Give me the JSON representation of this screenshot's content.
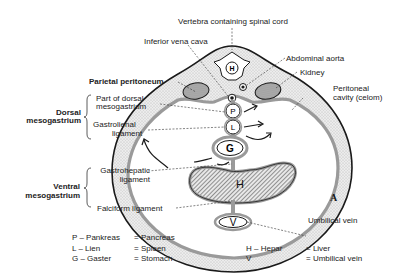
{
  "figure": {
    "letter": "A",
    "labels": {
      "vertebra": "Vertebra containing spinal cord",
      "inferior_vena_cava": "Inferior vena cava",
      "abdominal_aorta": "Abdominal aorta",
      "kidney": "Kidney",
      "parietal_peritoneum": "Parietal peritoneum",
      "peritoneal_cavity_line1": "Peritoneal",
      "peritoneal_cavity_line2": "cavity (celom)",
      "part_dorsal_line1": "Part of dorsal",
      "part_dorsal_line2": "mesogastrium",
      "gastrolienal_line1": "Gastrolienal",
      "gastrolienal_line2": "ligament",
      "dorsal_meso_line1": "Dorsal",
      "dorsal_meso_line2": "mesogastrium",
      "gastrohepatic_line1": "Gastrohepatic",
      "gastrohepatic_line2": "ligament",
      "ventral_meso_line1": "Ventral",
      "ventral_meso_line2": "mesogastrium",
      "falciform": "Falciform ligament",
      "umbilical_vein": "Umbilical vein"
    },
    "organ_letters": {
      "pancreas": "P",
      "spleen": "L",
      "stomach": "G",
      "liver": "H",
      "umbilical_vein": "V"
    }
  },
  "legend": [
    {
      "key": "P – Pankreas",
      "value": "= Pancreas"
    },
    {
      "key": "L – Lien",
      "value": "= Spleen"
    },
    {
      "key": "G – Gaster",
      "value": "= Stomach"
    },
    {
      "key": "H – Hepar",
      "value": "= Liver"
    },
    {
      "key": "V",
      "value": "= Umbilical vein"
    }
  ],
  "colors": {
    "outline": "#1a1a1a",
    "stipple": "#d9d9d9",
    "peritoneum_band": "#9a9a9a",
    "kidney_fill": "#a8a8a8",
    "hatch": "#555555"
  }
}
